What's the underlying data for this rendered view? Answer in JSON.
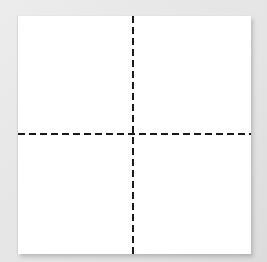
{
  "scene": {
    "description": "white square card divided into four quadrants by dashed cross lines",
    "background_color": "#e6e6e6",
    "card_color": "#ffffff",
    "line_color": "#1a1a1a",
    "line_style": "dashed",
    "quadrants": 4
  }
}
